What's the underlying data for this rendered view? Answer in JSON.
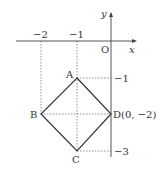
{
  "diagram": {
    "axes": {
      "x_label": "x",
      "y_label": "y",
      "origin_label": "O"
    },
    "ticks": {
      "x": [
        {
          "value": -2,
          "label": "−2"
        },
        {
          "value": -1,
          "label": "−1"
        }
      ],
      "y": [
        {
          "value": -1,
          "label": "−1"
        },
        {
          "value": -3,
          "label": "−3"
        }
      ]
    },
    "points": {
      "A": {
        "label": "A",
        "x": -1,
        "y": -1
      },
      "B": {
        "label": "B",
        "x": -2,
        "y": -2
      },
      "C": {
        "label": "C",
        "x": -1,
        "y": -3
      },
      "D": {
        "label": "D(0, −2)",
        "x": 0,
        "y": -2
      }
    },
    "shape": "square ABCD (rotated 45°)",
    "colors": {
      "lines": "#333333",
      "dashed": "#666666"
    }
  }
}
